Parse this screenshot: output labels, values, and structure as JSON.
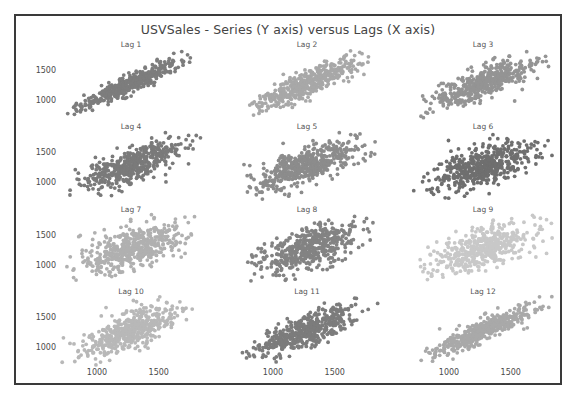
{
  "figure": {
    "title": "USVSales - Series (Y axis) versus Lags (X axis)",
    "border_color": "#3a3a3a",
    "background": "#ffffff"
  },
  "chart_data": {
    "type": "scatter",
    "title": "USVSales - Series (Y axis) versus Lags (X axis)",
    "xlabel": "Lags (X axis)",
    "ylabel": "Series (Y axis)",
    "grid": false,
    "legend": false,
    "layout": {
      "rows": 4,
      "cols": 3,
      "panels": 12
    },
    "xlim": [
      700,
      1850
    ],
    "ylim": [
      700,
      1850
    ],
    "xticks": [
      1000,
      1500
    ],
    "yticks": [
      1000,
      1500
    ],
    "xtick_labels": [
      "1000",
      "1500"
    ],
    "ytick_labels": [
      "1000",
      "1500"
    ],
    "n_points_per_panel": 480,
    "panels": [
      {
        "label": "Lag 1",
        "lag": 1,
        "color": "#7d7d7d",
        "correlation": 0.93,
        "mean_x": 1275,
        "mean_y": 1275,
        "sd": 200
      },
      {
        "label": "Lag 2",
        "lag": 2,
        "color": "#a8a8a8",
        "correlation": 0.86,
        "mean_x": 1275,
        "mean_y": 1275,
        "sd": 200
      },
      {
        "label": "Lag 3",
        "lag": 3,
        "color": "#949494",
        "correlation": 0.8,
        "mean_x": 1275,
        "mean_y": 1275,
        "sd": 200
      },
      {
        "label": "Lag 4",
        "lag": 4,
        "color": "#7a7a7a",
        "correlation": 0.74,
        "mean_x": 1275,
        "mean_y": 1275,
        "sd": 200
      },
      {
        "label": "Lag 5",
        "lag": 5,
        "color": "#8c8c8c",
        "correlation": 0.66,
        "mean_x": 1275,
        "mean_y": 1275,
        "sd": 200
      },
      {
        "label": "Lag 6",
        "lag": 6,
        "color": "#6f6f6f",
        "correlation": 0.6,
        "mean_x": 1275,
        "mean_y": 1275,
        "sd": 200
      },
      {
        "label": "Lag 7",
        "lag": 7,
        "color": "#b0b0b0",
        "correlation": 0.55,
        "mean_x": 1275,
        "mean_y": 1275,
        "sd": 200
      },
      {
        "label": "Lag 8",
        "lag": 8,
        "color": "#838383",
        "correlation": 0.58,
        "mean_x": 1275,
        "mean_y": 1275,
        "sd": 200
      },
      {
        "label": "Lag 9",
        "lag": 9,
        "color": "#c8c8c8",
        "correlation": 0.62,
        "mean_x": 1275,
        "mean_y": 1275,
        "sd": 200
      },
      {
        "label": "Lag 10",
        "lag": 10,
        "color": "#b8b8b8",
        "correlation": 0.7,
        "mean_x": 1275,
        "mean_y": 1275,
        "sd": 200
      },
      {
        "label": "Lag 11",
        "lag": 11,
        "color": "#7c7c7c",
        "correlation": 0.78,
        "mean_x": 1275,
        "mean_y": 1275,
        "sd": 200
      },
      {
        "label": "Lag 12",
        "lag": 12,
        "color": "#a9a9a9",
        "correlation": 0.88,
        "mean_x": 1275,
        "mean_y": 1275,
        "sd": 200
      }
    ]
  }
}
